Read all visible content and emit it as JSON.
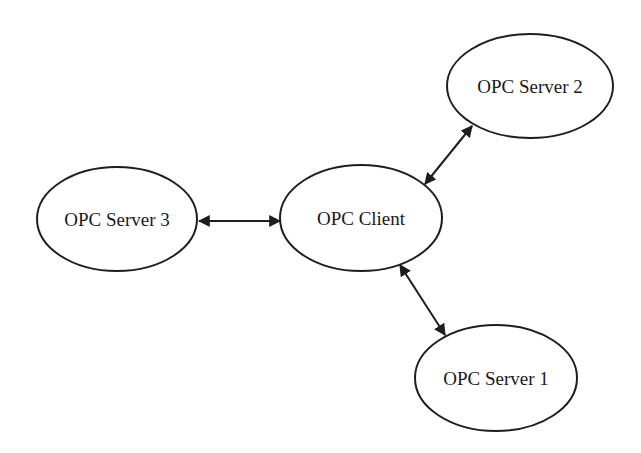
{
  "diagram": {
    "type": "network-topology",
    "colors": {
      "background": "#ffffff",
      "stroke": "#1e1e1e",
      "text": "#1a1a1a"
    },
    "nodes": [
      {
        "id": "client",
        "label": "OPC Client",
        "cx": 361,
        "cy": 218,
        "rx": 81,
        "ry": 53
      },
      {
        "id": "server2",
        "label": "OPC Server 2",
        "cx": 530,
        "cy": 86,
        "rx": 83,
        "ry": 52
      },
      {
        "id": "server3",
        "label": "OPC Server 3",
        "cx": 117,
        "cy": 219,
        "rx": 80,
        "ry": 52
      },
      {
        "id": "server1",
        "label": "OPC Server 1",
        "cx": 496,
        "cy": 378,
        "rx": 81,
        "ry": 53
      }
    ],
    "edges": [
      {
        "from": "server3",
        "to": "client",
        "direction": "bidirectional",
        "x1": 199,
        "y1": 221,
        "x2": 280,
        "y2": 221
      },
      {
        "from": "server2",
        "to": "client",
        "direction": "bidirectional",
        "x1": 472,
        "y1": 126,
        "x2": 425,
        "y2": 184
      },
      {
        "from": "client",
        "to": "server1",
        "direction": "bidirectional",
        "x1": 400,
        "y1": 265,
        "x2": 445,
        "y2": 335
      }
    ]
  }
}
